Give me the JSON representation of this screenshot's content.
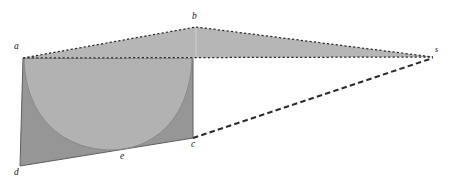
{
  "figure": {
    "title": "",
    "type": "geometric-perspective-diagram",
    "background_color": "#ffffff",
    "width": 453,
    "height": 191,
    "colors": {
      "upper_wedge_fill": "#b6b6b6",
      "front_face_outer_fill": "#969696",
      "parabola_inner_fill": "#b2b2b2",
      "line_color": "#2b2b2b",
      "faint_line_color": "#cfcfcf",
      "label_color": "#141414"
    },
    "points": [
      {
        "id": "a",
        "label": "a",
        "x": 23,
        "y": 58,
        "label_x": 14,
        "label_y": 42
      },
      {
        "id": "b",
        "label": "b",
        "x": 196,
        "y": 27,
        "label_x": 192,
        "label_y": 12
      },
      {
        "id": "c",
        "label": "c",
        "x": 193,
        "y": 138,
        "label_x": 191,
        "label_y": 140
      },
      {
        "id": "d",
        "label": "d",
        "x": 20,
        "y": 166,
        "label_x": 14,
        "label_y": 168
      },
      {
        "id": "e",
        "label": "e",
        "x": 122,
        "y": 150,
        "label_x": 120,
        "label_y": 152
      },
      {
        "id": "s",
        "label": "s",
        "x": 433,
        "y": 57,
        "label_x": 435,
        "label_y": 46
      }
    ],
    "edges": [
      {
        "id": "a-b",
        "from": "a",
        "to": "b",
        "style": "dotted"
      },
      {
        "id": "b-s",
        "from": "b",
        "to": "s",
        "style": "dotted"
      },
      {
        "id": "a-s",
        "from": "a",
        "to": "s",
        "style": "dotted"
      },
      {
        "id": "c-s",
        "from": "c",
        "to": "s",
        "style": "dashed"
      },
      {
        "id": "a-d",
        "from": "a",
        "to": "d",
        "style": "solid"
      },
      {
        "id": "d-c",
        "from": "d",
        "to": "c",
        "style": "solid"
      },
      {
        "id": "c-a",
        "from": "c",
        "to": "a",
        "style": "solid"
      },
      {
        "id": "b-baseline",
        "from": "b",
        "to": "baseline",
        "style": "faint"
      }
    ],
    "regions": [
      {
        "id": "upper-wedge",
        "label": "triangle a-b-s",
        "fill": "#b6b6b6"
      },
      {
        "id": "front-face",
        "label": "quadrilateral a-c-e-d",
        "fill": "#969696"
      },
      {
        "id": "parabola-area",
        "label": "parabolic segment a-e-c",
        "fill": "#b2b2b2"
      }
    ]
  }
}
